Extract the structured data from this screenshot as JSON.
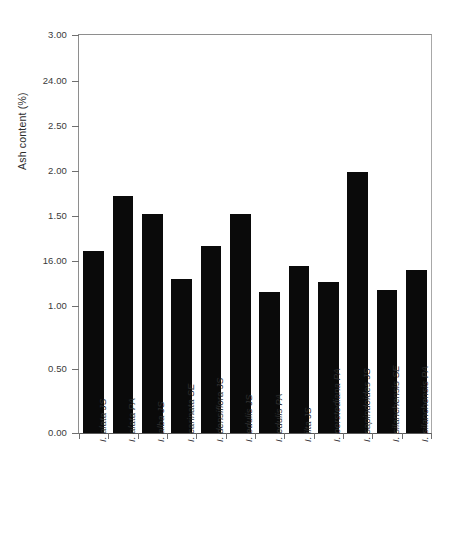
{
  "chart_data": {
    "type": "bar",
    "title": "",
    "subtitle": "",
    "xlabel": "",
    "ylabel": "Ash content (%)",
    "ylim": [
      0,
      3.0
    ],
    "grid": false,
    "legend": null,
    "orientation": "vertical",
    "bar_color": "#0a0a0a",
    "axis_color": "#6f6f6f",
    "ytick_labels": [
      "3.00",
      "24.00",
      "2.50",
      "2.00",
      "1.50",
      "16.00",
      "1.00",
      "0.50",
      "0.00"
    ],
    "ytick_values": [
      3.0,
      2.75,
      2.5,
      2.0,
      1.5,
      1.25,
      1.0,
      0.5,
      0.0
    ],
    "ytick_positions_pct": [
      100,
      88.44,
      77.14,
      65.83,
      54.52,
      43.22,
      31.91,
      16.08,
      0
    ],
    "categories": [
      "I. alata JS",
      "I. alata PA",
      "I. alba JS",
      "I. carinata SE",
      "I. densiflora JS",
      "I. edulis JS",
      "I. edulis PA",
      "I. ilta JS",
      "I. oerstediana PA",
      "I. sapindoides JS",
      "I. silanchensis SE",
      "I. silanchensis PA"
    ],
    "values": [
      1.37,
      1.79,
      1.65,
      1.16,
      1.41,
      1.65,
      1.06,
      1.26,
      1.14,
      1.97,
      1.08,
      1.23
    ]
  }
}
